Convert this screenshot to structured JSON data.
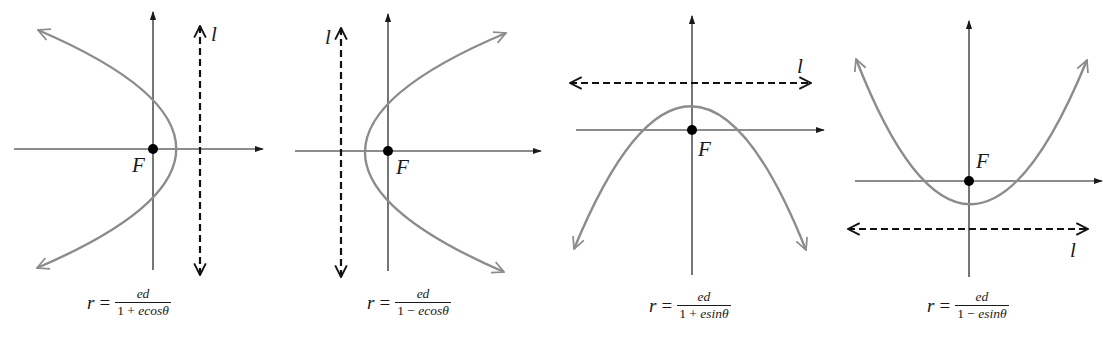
{
  "figure": {
    "colors": {
      "axis": "#1a1a1a",
      "curve": "#8c8c8c",
      "directrix": "#111111",
      "focus": "#000000",
      "background": "#ffffff"
    },
    "panels": [
      {
        "id": "panel-1",
        "focus_label": "F",
        "directrix_label": "l",
        "opens": "left",
        "directrix_position": "right of focus (x = d)",
        "formula": {
          "lhs": "r",
          "eq": "=",
          "numerator": "ed",
          "denominator_const": "1 + ",
          "denominator_term": "ecosθ"
        }
      },
      {
        "id": "panel-2",
        "focus_label": "F",
        "directrix_label": "l",
        "opens": "right",
        "directrix_position": "left of focus (x = -d)",
        "formula": {
          "lhs": "r",
          "eq": "=",
          "numerator": "ed",
          "denominator_const": "1 − ",
          "denominator_term": "ecosθ"
        }
      },
      {
        "id": "panel-3",
        "focus_label": "F",
        "directrix_label": "l",
        "opens": "down",
        "directrix_position": "above focus (y = d)",
        "formula": {
          "lhs": "r",
          "eq": "=",
          "numerator": "ed",
          "denominator_const": "1 + ",
          "denominator_term": "esinθ"
        }
      },
      {
        "id": "panel-4",
        "focus_label": "F",
        "directrix_label": "l",
        "opens": "up",
        "directrix_position": "below focus (y = -d)",
        "formula": {
          "lhs": "r",
          "eq": "=",
          "numerator": "ed",
          "denominator_const": "1 − ",
          "denominator_term": "esinθ"
        }
      }
    ]
  }
}
